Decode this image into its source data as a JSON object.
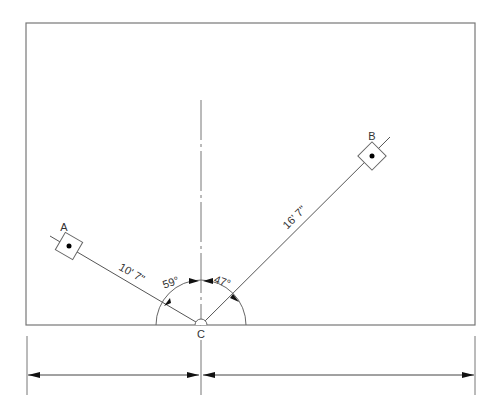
{
  "diagram": {
    "points": {
      "a": {
        "label": "A"
      },
      "b": {
        "label": "B"
      },
      "c": {
        "label": "C"
      }
    },
    "dimensions": {
      "ca_length": "10' 7\"",
      "cb_length": "16' 7\"",
      "angle_a": "59°",
      "angle_b": "47°"
    },
    "colors": {
      "line": "#555555",
      "arrow": "#111111",
      "dot": "#000000"
    }
  }
}
